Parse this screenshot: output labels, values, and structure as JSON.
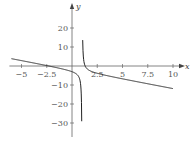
{
  "chart_data": {
    "type": "line",
    "title": "",
    "xlabel": "x",
    "ylabel": "y",
    "xlim": [
      -6,
      10
    ],
    "ylim": [
      -35,
      27
    ],
    "grid": false,
    "x_ticks": [
      -5,
      -2.5,
      2.5,
      5,
      7.5,
      10
    ],
    "x_tick_labels": [
      "−5",
      "−2.5",
      "2.5",
      "5",
      "7.5",
      "10"
    ],
    "y_ticks": [
      20,
      10,
      -10,
      -20,
      -30
    ],
    "y_tick_labels": [
      "20",
      "10",
      "−10",
      "−20",
      "−30"
    ],
    "vertical_asymptote": 1,
    "series": [
      {
        "name": "f(x)",
        "x": [
          -6,
          -5,
          -4,
          -3,
          -2,
          -1,
          0,
          0.5,
          0.8,
          0.9,
          0.95
        ],
        "y": [
          3.9,
          2.8,
          1.8,
          0.8,
          -0.3,
          -1.5,
          -3,
          -4.5,
          -7.8,
          -12.9,
          -23
        ]
      },
      {
        "name": "f(x)",
        "x": [
          1.04,
          1.1,
          1.2,
          1.5,
          2,
          2.5,
          3,
          4,
          5,
          7.5,
          10
        ],
        "y": [
          22,
          6.9,
          1.8,
          -1.5,
          -3,
          -3.8,
          -4.5,
          -5.7,
          -6.8,
          -9.3,
          -11.9
        ]
      }
    ]
  }
}
